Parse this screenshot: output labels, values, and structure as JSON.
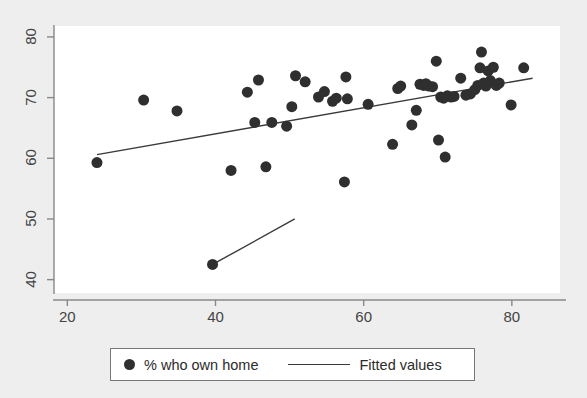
{
  "figure": {
    "background_color": "#eeeeee",
    "plot_background_color": "#ffffff",
    "marker_color": "#2f2f2f",
    "line_color": "#3a3a3a",
    "axis_color": "#888888"
  },
  "legend": {
    "entries": [
      {
        "label": "% who own home",
        "symbol": "filled-circle",
        "color": "#2f2f2f"
      },
      {
        "label": "Fitted values",
        "symbol": "line",
        "color": "#3a3a3a"
      }
    ]
  },
  "axes": {
    "x_ticks": [
      {
        "value": 20,
        "label": "20"
      },
      {
        "value": 40,
        "label": "40"
      },
      {
        "value": 60,
        "label": "60"
      },
      {
        "value": 80,
        "label": "80"
      }
    ],
    "y_ticks": [
      {
        "value": 40,
        "label": "40"
      },
      {
        "value": 50,
        "label": "50"
      },
      {
        "value": 60,
        "label": "60"
      },
      {
        "value": 70,
        "label": "70"
      },
      {
        "value": 80,
        "label": "80"
      }
    ]
  },
  "chart_data": {
    "type": "scatter",
    "title": "",
    "subtitle": "",
    "xlabel": "",
    "ylabel": "",
    "xlim": [
      18.2,
      86.5
    ],
    "ylim": [
      37.8,
      81.8
    ],
    "grid": false,
    "legend_position": "bottom",
    "series": [
      {
        "name": "% who own home",
        "type": "scatter",
        "marker": "filled-circle",
        "marker_size": 11,
        "color": "#2f2f2f",
        "points": [
          [
            24.0,
            59.3
          ],
          [
            30.3,
            69.6
          ],
          [
            34.8,
            67.8
          ],
          [
            39.6,
            42.5
          ],
          [
            42.1,
            58.0
          ],
          [
            44.3,
            70.9
          ],
          [
            45.3,
            65.9
          ],
          [
            45.8,
            72.9
          ],
          [
            46.8,
            58.6
          ],
          [
            47.6,
            65.9
          ],
          [
            49.6,
            65.3
          ],
          [
            50.3,
            68.5
          ],
          [
            50.8,
            73.6
          ],
          [
            52.1,
            72.6
          ],
          [
            53.9,
            70.1
          ],
          [
            54.7,
            71.0
          ],
          [
            55.8,
            69.4
          ],
          [
            56.3,
            69.9
          ],
          [
            57.4,
            56.1
          ],
          [
            57.6,
            73.4
          ],
          [
            57.8,
            69.8
          ],
          [
            60.6,
            68.9
          ],
          [
            63.9,
            62.3
          ],
          [
            64.6,
            71.5
          ],
          [
            65.0,
            71.9
          ],
          [
            66.5,
            65.5
          ],
          [
            67.1,
            67.9
          ],
          [
            67.6,
            72.2
          ],
          [
            68.1,
            72.0
          ],
          [
            68.4,
            72.3
          ],
          [
            68.8,
            71.9
          ],
          [
            69.3,
            71.8
          ],
          [
            69.8,
            76.0
          ],
          [
            70.1,
            63.0
          ],
          [
            70.4,
            70.1
          ],
          [
            70.8,
            69.9
          ],
          [
            71.0,
            60.2
          ],
          [
            71.3,
            70.3
          ],
          [
            71.8,
            70.1
          ],
          [
            72.2,
            70.2
          ],
          [
            73.1,
            73.2
          ],
          [
            73.8,
            70.4
          ],
          [
            74.4,
            70.6
          ],
          [
            75.0,
            71.3
          ],
          [
            75.4,
            72.0
          ],
          [
            75.7,
            74.9
          ],
          [
            75.9,
            77.5
          ],
          [
            76.2,
            72.4
          ],
          [
            76.5,
            71.9
          ],
          [
            76.8,
            74.4
          ],
          [
            77.1,
            72.8
          ],
          [
            77.5,
            75.0
          ],
          [
            77.9,
            72.0
          ],
          [
            78.3,
            72.4
          ],
          [
            79.9,
            68.8
          ],
          [
            81.6,
            74.9
          ]
        ]
      }
    ],
    "fitted_lines": [
      {
        "name": "Fitted values",
        "color": "#3a3a3a",
        "width": 1.4,
        "from": [
          24.0,
          60.6
        ],
        "to": [
          82.8,
          73.2
        ]
      },
      {
        "name": "Fitted values",
        "color": "#3a3a3a",
        "width": 1.4,
        "from": [
          39.6,
          42.5
        ],
        "to": [
          50.7,
          50.0
        ]
      }
    ]
  }
}
